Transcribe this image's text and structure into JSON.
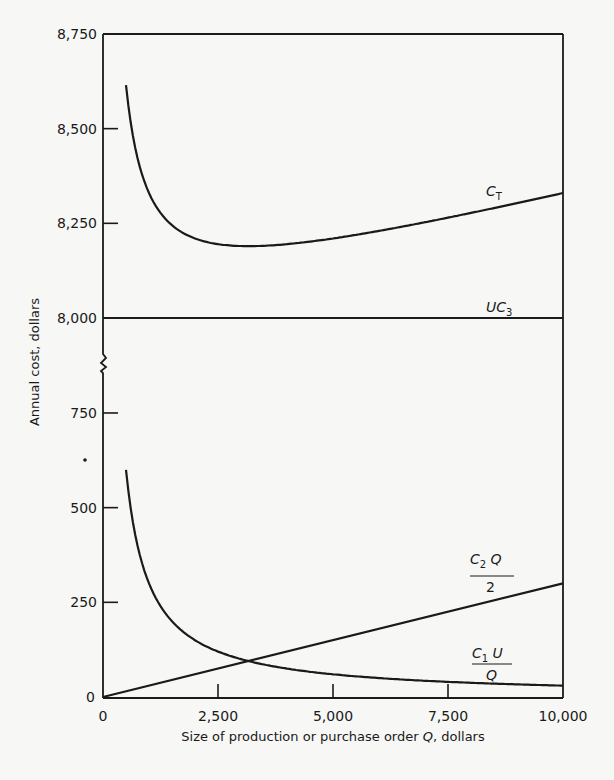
{
  "chart_data": {
    "type": "line",
    "title": "",
    "xlabel": "Size of production or purchase order Q, dollars",
    "ylabel": "Annual cost, dollars",
    "x_ticks": [
      "0",
      "2,500",
      "5,000",
      "7,500",
      "10,000"
    ],
    "x_tick_values": [
      0,
      2500,
      5000,
      7500,
      10000
    ],
    "xlim": [
      0,
      10000
    ],
    "y_axis_broken": true,
    "y_upper_ticks": [
      "8,000",
      "8,250",
      "8,500",
      "8,750"
    ],
    "y_upper_tick_values": [
      8000,
      8250,
      8500,
      8750
    ],
    "y_lower_ticks": [
      "0",
      "250",
      "500",
      "750"
    ],
    "y_lower_tick_values": [
      0,
      250,
      500,
      750
    ],
    "ylim_upper": [
      8000,
      8750
    ],
    "ylim_lower": [
      0,
      750
    ],
    "grid": false,
    "legend": "none (curves labeled inline)",
    "x": [
      500,
      1000,
      1500,
      2000,
      2500,
      3162,
      4000,
      5000,
      6000,
      7000,
      7500,
      8000,
      9000,
      10000
    ],
    "series": [
      {
        "name": "C_T",
        "label_main": "C",
        "label_sub": "T",
        "panel": "upper",
        "values": [
          8615,
          8330,
          8245,
          8210,
          8195,
          8190,
          8195,
          8210,
          8230,
          8253,
          8265,
          8278,
          8303,
          8330
        ]
      },
      {
        "name": "UC_3",
        "label_main": "UC",
        "label_sub": "3",
        "panel": "upper",
        "values": [
          8000,
          8000,
          8000,
          8000,
          8000,
          8000,
          8000,
          8000,
          8000,
          8000,
          8000,
          8000,
          8000,
          8000
        ]
      },
      {
        "name": "C_2 Q / 2",
        "label_num": "C",
        "label_num_sub": "2",
        "label_num_tail": " Q",
        "label_den": "2",
        "panel": "lower",
        "x_full": [
          0,
          10000
        ],
        "values_full": [
          0,
          300
        ]
      },
      {
        "name": "C_1 U / Q",
        "label_num": "C",
        "label_num_sub": "1",
        "label_num_tail": " U",
        "label_den": "Q",
        "panel": "lower",
        "values": [
          600,
          300,
          200,
          150,
          120,
          95,
          75,
          60,
          50,
          43,
          40,
          38,
          33,
          30
        ]
      }
    ],
    "annotations": [
      {
        "text": "Intersection of C2Q/2 and C1U/Q near Q ≈ 3,160, cost ≈ 95 (minimum of C_T)"
      }
    ]
  },
  "labels": {
    "x_axis_title": "Size of production or purchase order ",
    "x_axis_title_var": "Q",
    "x_axis_title_tail": ", dollars",
    "y_axis_title": "Annual cost, dollars"
  }
}
